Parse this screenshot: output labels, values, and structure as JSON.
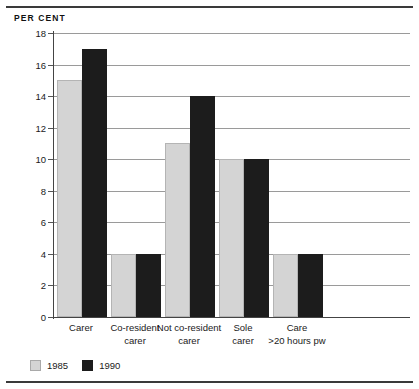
{
  "chart_data": {
    "type": "bar",
    "title": "",
    "axis_label_top": "PER CENT",
    "xlabel": "",
    "ylabel": "PER CENT",
    "ylim": [
      0,
      18
    ],
    "ytick_step": 2,
    "yticks": [
      0,
      2,
      4,
      6,
      8,
      10,
      12,
      14,
      16,
      18
    ],
    "ytick_labels": [
      "0",
      "2",
      "4",
      "6",
      "8",
      "10",
      "12",
      "14",
      "16",
      "18"
    ],
    "grid": true,
    "grid_axis": "y",
    "legend_position": "bottom-left",
    "categories": [
      "Carer",
      "Co-resident carer",
      "Not co-resident carer",
      "Sole carer",
      "Care >20 hours pw"
    ],
    "category_lines": [
      [
        "Carer"
      ],
      [
        "Co-resident",
        "carer"
      ],
      [
        "Not co-resident",
        "carer"
      ],
      [
        "Sole",
        "carer"
      ],
      [
        "Care",
        ">20 hours pw"
      ]
    ],
    "series": [
      {
        "name": "1985",
        "color": "#d4d4d4",
        "values": [
          15,
          4,
          11,
          10,
          4
        ]
      },
      {
        "name": "1990",
        "color": "#1c1c1c",
        "values": [
          17,
          4,
          14,
          10,
          4
        ]
      }
    ]
  },
  "legend": {
    "items": [
      {
        "label": "1985",
        "swatch": "light-gray-swatch"
      },
      {
        "label": "1990",
        "swatch": "black-swatch"
      }
    ]
  }
}
